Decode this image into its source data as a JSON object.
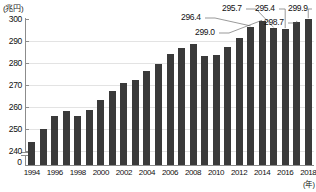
{
  "chart_data": {
    "type": "bar",
    "title": "",
    "subtitle": "",
    "xlabel": "(年)",
    "ylabel": "(兆円)",
    "ylim": [
      236,
      300
    ],
    "yticks": [
      240,
      250,
      260,
      270,
      280,
      290,
      300
    ],
    "ytick_labels": [
      "240",
      "250",
      "260",
      "270",
      "280",
      "290",
      "300"
    ],
    "axis_break": true,
    "zero_tick_label": "0",
    "grid": true,
    "legend": "none",
    "categories": [
      "1994",
      "1995",
      "1996",
      "1997",
      "1998",
      "1999",
      "2000",
      "2001",
      "2002",
      "2003",
      "2004",
      "2005",
      "2006",
      "2007",
      "2008",
      "2009",
      "2010",
      "2011",
      "2012",
      "2013",
      "2014",
      "2015",
      "2016",
      "2017",
      "2018"
    ],
    "xtick_labels": [
      "1994",
      "1996",
      "1998",
      "2000",
      "2002",
      "2004",
      "2006",
      "2008",
      "2010",
      "2012",
      "2014",
      "2016",
      "2018"
    ],
    "values": [
      244.0,
      250.0,
      256.0,
      258.0,
      256.0,
      258.5,
      263.0,
      267.5,
      271.0,
      272.5,
      276.5,
      279.5,
      284.0,
      287.0,
      288.5,
      283.0,
      283.5,
      287.5,
      291.5,
      296.4,
      299.0,
      295.7,
      295.4,
      298.7,
      299.9
    ],
    "annotations": [
      {
        "label": "296.4",
        "category": "2013",
        "value": 296.4
      },
      {
        "label": "299.0",
        "category": "2014",
        "value": 299.0
      },
      {
        "label": "295.7",
        "category": "2015",
        "value": 295.7
      },
      {
        "label": "295.4",
        "category": "2016",
        "value": 295.4
      },
      {
        "label": "298.7",
        "category": "2017",
        "value": 298.7
      },
      {
        "label": "299.9",
        "category": "2018",
        "value": 299.9
      }
    ],
    "bar_color": "#3a3a3a",
    "grid_color": "#e3e3e3",
    "axis_color": "#8c8c8c"
  }
}
